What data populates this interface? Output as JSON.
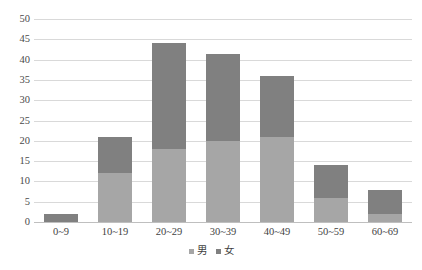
{
  "chart_data": {
    "type": "bar",
    "subtype": "stacked-bar",
    "title": "",
    "xlabel": "",
    "ylabel": "",
    "categories": [
      "0~9",
      "10~19",
      "20~29",
      "30~39",
      "40~49",
      "50~59",
      "60~69"
    ],
    "series": [
      {
        "name": "男",
        "color": "#a6a6a6",
        "values": [
          0,
          12,
          18,
          20,
          21,
          6,
          2
        ]
      },
      {
        "name": "女",
        "color": "#808080",
        "values": [
          2,
          9,
          26,
          21.5,
          15,
          8,
          6
        ]
      }
    ],
    "totals": [
      2,
      21,
      44,
      41.5,
      36,
      14,
      8
    ],
    "ylim": [
      0,
      50
    ],
    "ytick_step": 5,
    "ytick_labels": [
      "0",
      "5",
      "10",
      "15",
      "20",
      "25",
      "30",
      "35",
      "40",
      "45",
      "50"
    ],
    "grid": true,
    "grid_color": "#d9d9d9",
    "legend_position": "bottom",
    "legend": [
      {
        "label": "男",
        "color": "#a6a6a6"
      },
      {
        "label": "女",
        "color": "#808080"
      }
    ]
  }
}
